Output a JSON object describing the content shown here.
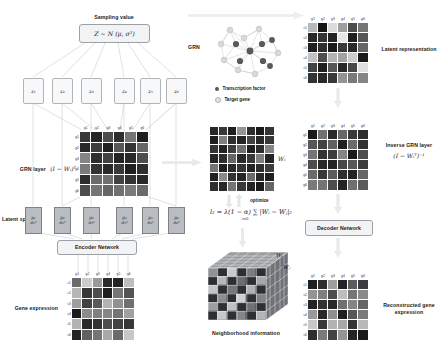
{
  "figure": {
    "top_arrow": "arrow-right"
  },
  "left_panel": {
    "sampling_label": "Sampling value",
    "sampling_formula": "Z ~ N (μ, σ²)",
    "z_nodes": [
      "z₁",
      "z₂",
      "z₃",
      "z₄",
      "z₅",
      "z₆"
    ],
    "grn_layer_label": "GRN layer",
    "grn_layer_formula": "(I − Wᵢ)ᵀ",
    "latent_space_label": "Latent space",
    "latent_nodes": [
      {
        "mu": "μ₁",
        "sigma": "σ₁²"
      },
      {
        "mu": "μ₂",
        "sigma": "σ₂²"
      },
      {
        "mu": "μ₃",
        "sigma": "σ₃²"
      },
      {
        "mu": "μ₄",
        "sigma": "σ₄²"
      },
      {
        "mu": "μ₅",
        "sigma": "σ₅²"
      },
      {
        "mu": "μ₆",
        "sigma": "σ₆²"
      }
    ],
    "encoder_label": "Encoder Network",
    "gene_expression_label": "Gene expression"
  },
  "middle_panel": {
    "grn_label": "GRN",
    "legend": [
      {
        "name": "Transcription factor",
        "color": "#595959"
      },
      {
        "name": "Target gene",
        "color": "#d9d9d9"
      }
    ],
    "w_matrix_label": "Wᵢ",
    "optimize_label": "optimize",
    "loss_formula": "l₂ = λ(1 − α) ∑ |Wᵢ − Wⱼ|₂",
    "loss_subscript": "i∈Ω",
    "neighborhood_label": "Neighborhood information",
    "cube_labels": [
      "Wᵢ",
      "Wⱼ"
    ]
  },
  "right_panel": {
    "latent_representation_label": "Latent representation",
    "inverse_grn_label": "Inverse GRN layer",
    "inverse_grn_formula": "(I − Wᵢᵀ)⁻¹",
    "decoder_label": "Decoder Network",
    "reconstructed_label": "Reconstructed gene expression"
  },
  "axes": {
    "genes": [
      "g1",
      "g2",
      "g3",
      "g4",
      "g5",
      "g6"
    ],
    "cells": [
      "c1",
      "c2",
      "c3",
      "c4",
      "c5",
      "c6"
    ]
  },
  "chart_data": [
    {
      "type": "heatmap",
      "name": "gene_expression",
      "title": "Gene expression",
      "xlabel": "genes",
      "ylabel": "cells",
      "xticks": [
        "g1",
        "g2",
        "g3",
        "g4",
        "g5",
        "g6"
      ],
      "yticks": [
        "c1",
        "c2",
        "c3",
        "c4",
        "c5",
        "c6"
      ],
      "colormap": "gray",
      "values": [
        [
          0.42,
          0.8,
          0.6,
          0.17,
          0.14,
          0.74
        ],
        [
          0.71,
          0.22,
          0.3,
          0.12,
          0.46,
          0.33
        ],
        [
          0.62,
          0.26,
          0.35,
          0.7,
          0.57,
          0.44
        ],
        [
          0.1,
          0.55,
          0.5,
          0.52,
          0.46,
          0.63
        ],
        [
          0.7,
          0.16,
          0.2,
          0.3,
          0.26,
          0.22
        ],
        [
          0.14,
          0.38,
          0.46,
          0.66,
          0.42,
          0.78
        ]
      ]
    },
    {
      "type": "heatmap",
      "name": "grn_layer_matrix",
      "title": "GRN layer (I - Wi)^T",
      "xlabel": "genes",
      "ylabel": "genes",
      "xticks": [
        "g1",
        "g2",
        "g3",
        "g4",
        "g5",
        "g6"
      ],
      "yticks": [
        "g1",
        "g2",
        "g3",
        "g4",
        "g5",
        "g6"
      ],
      "colormap": "gray",
      "values": [
        [
          0.22,
          0.14,
          0.3,
          0.18,
          0.46,
          0.12
        ],
        [
          0.16,
          0.24,
          0.12,
          0.34,
          0.2,
          0.4
        ],
        [
          0.52,
          0.18,
          0.26,
          0.14,
          0.16,
          0.3
        ],
        [
          0.48,
          0.2,
          0.16,
          0.22,
          0.12,
          0.18
        ],
        [
          0.18,
          0.42,
          0.44,
          0.26,
          0.2,
          0.16
        ],
        [
          0.3,
          0.46,
          0.4,
          0.44,
          0.48,
          0.42
        ]
      ]
    },
    {
      "type": "heatmap",
      "name": "w_matrix",
      "title": "Wi",
      "xlabel": "",
      "ylabel": "",
      "xticks": [],
      "yticks": [],
      "colormap": "gray",
      "values": [
        [
          0.16,
          0.22,
          0.12,
          0.58,
          0.18,
          0.1,
          0.2
        ],
        [
          0.12,
          0.5,
          0.18,
          0.14,
          0.26,
          0.16,
          0.22
        ],
        [
          0.2,
          0.14,
          0.24,
          0.44,
          0.12,
          0.18,
          0.52
        ],
        [
          0.14,
          0.18,
          0.4,
          0.16,
          0.22,
          0.5,
          0.14
        ],
        [
          0.46,
          0.12,
          0.16,
          0.2,
          0.14,
          0.18,
          0.24
        ],
        [
          0.12,
          0.54,
          0.2,
          0.14,
          0.42,
          0.16,
          0.12
        ],
        [
          0.18,
          0.16,
          0.46,
          0.22,
          0.14,
          0.1,
          0.4
        ]
      ]
    },
    {
      "type": "heatmap",
      "name": "latent_representation",
      "title": "Latent representation",
      "xlabel": "genes",
      "ylabel": "cells",
      "xticks": [
        "g1",
        "g2",
        "g3",
        "g4",
        "g5",
        "g6"
      ],
      "yticks": [
        "c1",
        "c2",
        "c3",
        "c4",
        "c5",
        "c6"
      ],
      "colormap": "gray",
      "values": [
        [
          0.72,
          0.08,
          0.86,
          0.62,
          0.3,
          0.46
        ],
        [
          0.16,
          0.2,
          0.14,
          0.9,
          0.12,
          0.34
        ],
        [
          0.12,
          0.18,
          0.1,
          0.22,
          0.16,
          0.4
        ],
        [
          0.76,
          0.3,
          0.7,
          0.64,
          0.8,
          0.1
        ],
        [
          0.26,
          0.12,
          0.34,
          0.16,
          0.28,
          0.88
        ],
        [
          0.2,
          0.16,
          0.22,
          0.58,
          0.48,
          0.52
        ]
      ]
    },
    {
      "type": "heatmap",
      "name": "inverse_grn_layer",
      "title": "Inverse GRN layer (I - Wi^T)^-1",
      "xlabel": "genes",
      "ylabel": "genes",
      "xticks": [
        "g1",
        "g2",
        "g3",
        "g4",
        "g5",
        "g6"
      ],
      "yticks": [
        "g1",
        "g2",
        "g3",
        "g4",
        "g5",
        "g6"
      ],
      "colormap": "gray",
      "values": [
        [
          0.1,
          0.44,
          0.16,
          0.4,
          0.22,
          0.18
        ],
        [
          0.34,
          0.26,
          0.38,
          0.12,
          0.42,
          0.2
        ],
        [
          0.46,
          0.2,
          0.24,
          0.52,
          0.1,
          0.3
        ],
        [
          0.3,
          0.16,
          0.14,
          0.28,
          0.34,
          0.24
        ],
        [
          0.42,
          0.22,
          0.36,
          0.18,
          0.14,
          0.4
        ],
        [
          0.48,
          0.46,
          0.3,
          0.14,
          0.44,
          0.36
        ]
      ]
    },
    {
      "type": "heatmap",
      "name": "reconstructed_gene_expression",
      "title": "Reconstructed gene expression",
      "xlabel": "genes",
      "ylabel": "cells",
      "xticks": [
        "g1",
        "g2",
        "g3",
        "g4",
        "g5",
        "g6"
      ],
      "yticks": [
        "c1",
        "c2",
        "c3",
        "c4",
        "c5",
        "c6"
      ],
      "colormap": "gray",
      "values": [
        [
          0.12,
          0.18,
          0.62,
          0.14,
          0.36,
          0.24
        ],
        [
          0.58,
          0.5,
          0.3,
          0.74,
          0.46,
          0.54
        ],
        [
          0.14,
          0.2,
          0.16,
          0.44,
          0.52,
          0.4
        ],
        [
          0.6,
          0.16,
          0.56,
          0.12,
          0.34,
          0.48
        ],
        [
          0.78,
          0.22,
          0.7,
          0.66,
          0.2,
          0.72
        ],
        [
          0.18,
          0.48,
          0.26,
          0.58,
          0.14,
          0.1
        ]
      ]
    }
  ]
}
